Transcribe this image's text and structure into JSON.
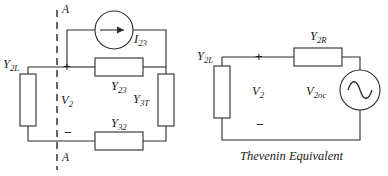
{
  "figure": {
    "background_color": "#ffffff",
    "line_color": "#2b2b2b",
    "text_color": "#1a1a1a"
  },
  "left_circuit": {
    "name": "original-network",
    "cut_line_label_top": "A",
    "cut_line_label_bottom": "A",
    "current_source": {
      "label_base": "I",
      "label_sub": "23",
      "type": "current-source",
      "arrow_direction": "right"
    },
    "elements": [
      {
        "id": "y2l",
        "label_base": "Y",
        "label_sub": "2L",
        "orientation": "vertical",
        "position": "left"
      },
      {
        "id": "y23",
        "label_base": "Y",
        "label_sub": "23",
        "orientation": "horizontal",
        "position": "middle"
      },
      {
        "id": "y3t",
        "label_base": "Y",
        "label_sub": "3T",
        "orientation": "vertical",
        "position": "right"
      },
      {
        "id": "y32",
        "label_base": "Y",
        "label_sub": "32",
        "orientation": "horizontal",
        "position": "bottom"
      }
    ],
    "port_voltage": {
      "label_base": "V",
      "label_sub": "2",
      "plus": "+",
      "minus": "−"
    }
  },
  "right_circuit": {
    "name": "thevenin-equivalent",
    "caption": "Thevenin Equivalent",
    "elements": [
      {
        "id": "y2l-r",
        "label_base": "Y",
        "label_sub": "2L",
        "orientation": "vertical",
        "position": "left"
      },
      {
        "id": "y2r",
        "label_base": "Y",
        "label_sub": "2R",
        "orientation": "horizontal",
        "position": "top"
      }
    ],
    "voltage_source": {
      "label_base": "V",
      "label_sub": "2oc",
      "type": "ac-voltage-source"
    },
    "port_voltage": {
      "label_base": "V",
      "label_sub": "2",
      "plus": "+",
      "minus": "−"
    }
  }
}
